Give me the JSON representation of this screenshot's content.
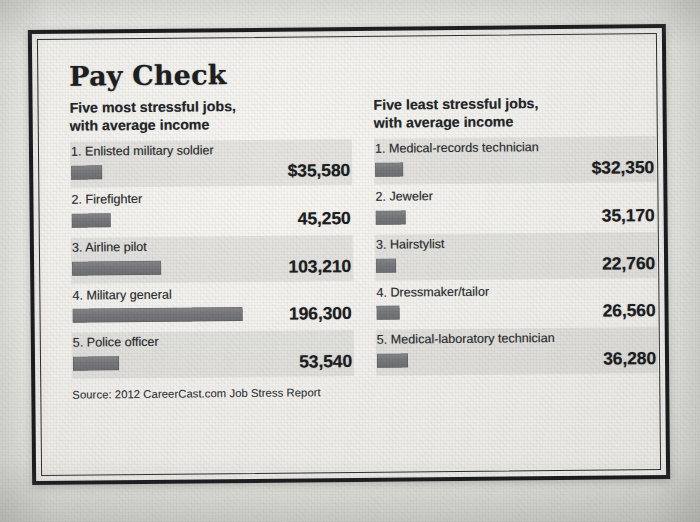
{
  "headline": "Pay Check",
  "source": "Source: 2012 CareerCast.com Job Stress Report",
  "colors": {
    "bar": "#76787b",
    "text": "#1d1e22",
    "frame": "#15161a",
    "paper": "#f0efeb",
    "band": "rgba(120,122,118,.135)"
  },
  "columns": [
    {
      "heading": "Five most stressful jobs,\nwith average income",
      "rows": [
        {
          "rank": "1.",
          "label": "1. Enlisted military soldier",
          "value": "$35,580",
          "amount": 35580
        },
        {
          "rank": "2.",
          "label": "2. Firefighter",
          "value": "45,250",
          "amount": 45250
        },
        {
          "rank": "3.",
          "label": "3. Airline pilot",
          "value": "103,210",
          "amount": 103210
        },
        {
          "rank": "4.",
          "label": "4. Military general",
          "value": "196,300",
          "amount": 196300
        },
        {
          "rank": "5.",
          "label": "5. Police officer",
          "value": "53,540",
          "amount": 53540
        }
      ]
    },
    {
      "heading": "Five least stressful jobs,\nwith average income",
      "rows": [
        {
          "rank": "1.",
          "label": "1. Medical-records technician",
          "value": "$32,350",
          "amount": 32350
        },
        {
          "rank": "2.",
          "label": "2. Jeweler",
          "value": "35,170",
          "amount": 35170
        },
        {
          "rank": "3.",
          "label": "3. Hairstylist",
          "value": "22,760",
          "amount": 22760
        },
        {
          "rank": "4.",
          "label": "4. Dressmaker/tailor",
          "value": "26,560",
          "amount": 26560
        },
        {
          "rank": "5.",
          "label": "5. Medical-laboratory technician",
          "value": "36,280",
          "amount": 36280
        }
      ]
    }
  ],
  "chart_data": {
    "type": "bar",
    "title": "Pay Check",
    "subtitle": "Average income for the five most and five least stressful jobs",
    "xlabel": "Average income (US$)",
    "ylabel": "",
    "orientation": "horizontal",
    "grid": false,
    "legend": false,
    "value_prefix": "$",
    "xlim": [
      0,
      196300
    ],
    "max_bar_px": 170,
    "source": "Source: 2012 CareerCast.com Job Stress Report",
    "series": [
      {
        "name": "Five most stressful jobs, with average income",
        "categories": [
          "Enlisted military soldier",
          "Firefighter",
          "Airline pilot",
          "Military general",
          "Police officer"
        ],
        "values": [
          35580,
          45250,
          103210,
          196300,
          53540
        ],
        "labels": [
          "$35,580",
          "45,250",
          "103,210",
          "196,300",
          "53,540"
        ]
      },
      {
        "name": "Five least stressful jobs, with average income",
        "categories": [
          "Medical-records technician",
          "Jeweler",
          "Hairstylist",
          "Dressmaker/tailor",
          "Medical-laboratory technician"
        ],
        "values": [
          32350,
          35170,
          22760,
          26560,
          36280
        ],
        "labels": [
          "$32,350",
          "35,170",
          "22,760",
          "26,560",
          "36,280"
        ]
      }
    ]
  }
}
